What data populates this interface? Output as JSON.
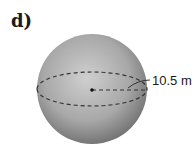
{
  "figure": {
    "label": "d)",
    "shape": "sphere",
    "radius_label": "10.5 m",
    "colors": {
      "sphere_light": "#c8c8c8",
      "sphere_dark": "#6a6a6a",
      "dashes": "#333333"
    }
  }
}
